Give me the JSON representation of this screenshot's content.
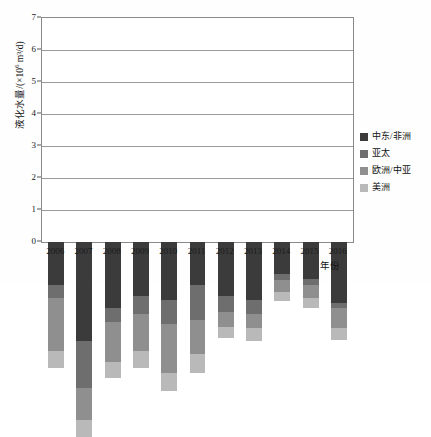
{
  "chart_data": {
    "type": "bar",
    "subtype": "stacked-vertical",
    "title": "",
    "xlabel": "年份",
    "ylabel": "液化水量/(×10⁶ m³/d)",
    "ylim": [
      0,
      7
    ],
    "ytick_labels": [
      "0",
      "1",
      "2",
      "3",
      "4",
      "5",
      "6",
      "7"
    ],
    "ytick_values": [
      0,
      1,
      2,
      3,
      4,
      5,
      6,
      7
    ],
    "grid": "horizontal",
    "legend_position": "right",
    "categories": [
      "2006",
      "2007",
      "2008",
      "2009",
      "2010",
      "2011",
      "2012",
      "2013",
      "2014",
      "2015",
      "2016"
    ],
    "series": [
      {
        "name": "美洲",
        "color": "#b9b9b9",
        "values": [
          0.55,
          0.55,
          0.5,
          0.55,
          0.55,
          0.6,
          0.35,
          0.4,
          0.3,
          0.3,
          0.35
        ]
      },
      {
        "name": "欧洲/中亚",
        "color": "#8f8f8f",
        "values": [
          1.65,
          1.0,
          1.25,
          1.15,
          1.55,
          1.05,
          0.45,
          0.45,
          0.35,
          0.4,
          0.65
        ]
      },
      {
        "name": "亚太",
        "color": "#6e6e6e",
        "values": [
          0.4,
          1.45,
          0.45,
          0.55,
          0.75,
          1.1,
          0.5,
          0.45,
          0.2,
          0.2,
          0.15
        ]
      },
      {
        "name": "中东/非洲",
        "color": "#3b3b3b",
        "values": [
          1.35,
          3.1,
          2.05,
          1.7,
          1.8,
          1.35,
          1.7,
          1.8,
          1.0,
          1.15,
          1.9
        ]
      }
    ],
    "totals": [
      3.95,
      6.1,
      4.25,
      3.95,
      4.65,
      4.1,
      3.0,
      3.1,
      1.85,
      2.05,
      3.05
    ]
  },
  "legend": {
    "items": [
      {
        "label": "中东/非洲",
        "color": "#3b3b3b"
      },
      {
        "label": "亚太",
        "color": "#6e6e6e"
      },
      {
        "label": "欧洲/中亚",
        "color": "#8f8f8f"
      },
      {
        "label": "美洲",
        "color": "#b9b9b9"
      }
    ]
  },
  "axes": {
    "y_title_prefix": "液化水量/(×10",
    "y_title_exp": "6",
    "y_title_suffix": " m³/d)",
    "x_title": "年份"
  }
}
